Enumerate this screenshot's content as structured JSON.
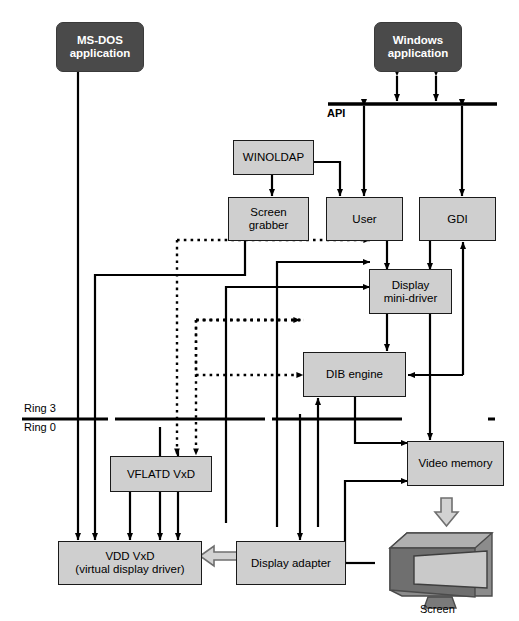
{
  "diagram": {
    "ring_labels": {
      "upper": "Ring 3",
      "lower": "Ring 0"
    },
    "api_label": "API",
    "screen_label": "Screen",
    "colors": {
      "box_fill": "#cfcfcf",
      "box_border": "#1a1a1a",
      "app_fill": "#4a4a4a",
      "app_text": "#ffffff",
      "line": "#000000",
      "hollow_arrow_fill": "#d2d2d2",
      "background": "#ffffff"
    },
    "nodes": [
      {
        "id": "msdos",
        "label": "MS-DOS\napplication",
        "line1": "MS-DOS",
        "line2": "application",
        "style": "dark"
      },
      {
        "id": "winapp",
        "label": "Windows\napplication",
        "line1": "Windows",
        "line2": "application",
        "style": "dark"
      },
      {
        "id": "winoldap",
        "label": "WINOLDAP",
        "line1": "WINOLDAP",
        "line2": "",
        "style": "gray"
      },
      {
        "id": "grabber",
        "label": "Screen\ngrabber",
        "line1": "Screen",
        "line2": "grabber",
        "style": "gray"
      },
      {
        "id": "user",
        "label": "User",
        "line1": "User",
        "line2": "",
        "style": "gray"
      },
      {
        "id": "gdi",
        "label": "GDI",
        "line1": "GDI",
        "line2": "",
        "style": "gray"
      },
      {
        "id": "minidrv",
        "label": "Display\nmini-driver",
        "line1": "Display",
        "line2": "mini-driver",
        "style": "gray"
      },
      {
        "id": "dib",
        "label": "DIB engine",
        "line1": "DIB engine",
        "line2": "",
        "style": "gray"
      },
      {
        "id": "vflatd",
        "label": "VFLATD VxD",
        "line1": "VFLATD VxD",
        "line2": "",
        "style": "gray"
      },
      {
        "id": "vidmem",
        "label": "Video memory",
        "line1": "Video memory",
        "line2": "",
        "style": "gray"
      },
      {
        "id": "vdd",
        "label": "VDD VxD\n(virtual display driver)",
        "line1": "VDD VxD",
        "line2": "(virtual display driver)",
        "style": "gray"
      },
      {
        "id": "adapter",
        "label": "Display adapter",
        "line1": "Display adapter",
        "line2": "",
        "style": "gray"
      }
    ]
  }
}
